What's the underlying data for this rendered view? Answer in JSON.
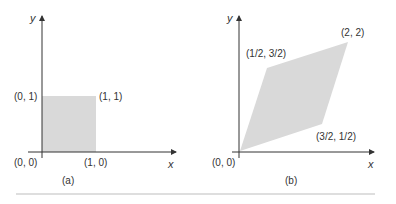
{
  "figure": {
    "panels": [
      {
        "caption": "(a)",
        "shape": "unit square",
        "axis_x_label": "x",
        "axis_y_label": "y",
        "vertices": [
          {
            "label": "(0, 0)",
            "x": 0,
            "y": 0
          },
          {
            "label": "(1, 0)",
            "x": 1,
            "y": 0
          },
          {
            "label": "(1, 1)",
            "x": 1,
            "y": 1
          },
          {
            "label": "(0, 1)",
            "x": 0,
            "y": 1
          }
        ]
      },
      {
        "caption": "(b)",
        "shape": "parallelogram",
        "axis_x_label": "x",
        "axis_y_label": "y",
        "vertices": [
          {
            "label": "(0, 0)",
            "x": 0,
            "y": 0
          },
          {
            "label": "(3/2, 1/2)",
            "x": 1.5,
            "y": 0.5
          },
          {
            "label": "(2, 2)",
            "x": 2,
            "y": 2
          },
          {
            "label": "(1/2, 3/2)",
            "x": 0.5,
            "y": 1.5
          }
        ]
      }
    ],
    "colors": {
      "fill": "#d9d9d9",
      "axis": "#333333",
      "text": "#333333",
      "rule": "#bdbdbd"
    }
  }
}
